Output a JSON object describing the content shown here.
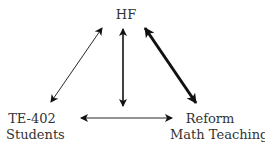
{
  "nodes": {
    "top": {
      "label": "HF"
    },
    "left": {
      "line1": "TE-402",
      "line2": "Students"
    },
    "right": {
      "line1": "Reform",
      "line2": "Math Teaching"
    }
  },
  "edges": [
    {
      "from": "TE-402 Students",
      "to": "HF",
      "weight": "thin"
    },
    {
      "from": "HF",
      "to": "center",
      "weight": "medium"
    },
    {
      "from": "HF",
      "to": "Reform Math Teaching",
      "weight": "thick"
    },
    {
      "from": "TE-402 Students",
      "to": "Reform Math Teaching",
      "weight": "thin"
    }
  ],
  "colors": {
    "stroke": "#111111",
    "text": "#333333"
  }
}
